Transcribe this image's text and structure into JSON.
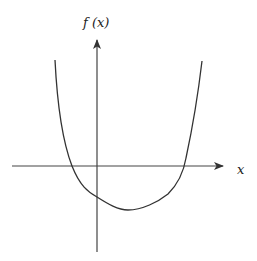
{
  "figure": {
    "y_axis_label": "f (x)",
    "x_axis_label": "x",
    "colors": {
      "curve": "#333333",
      "axes": "#333333",
      "background": "#ffffff"
    }
  }
}
